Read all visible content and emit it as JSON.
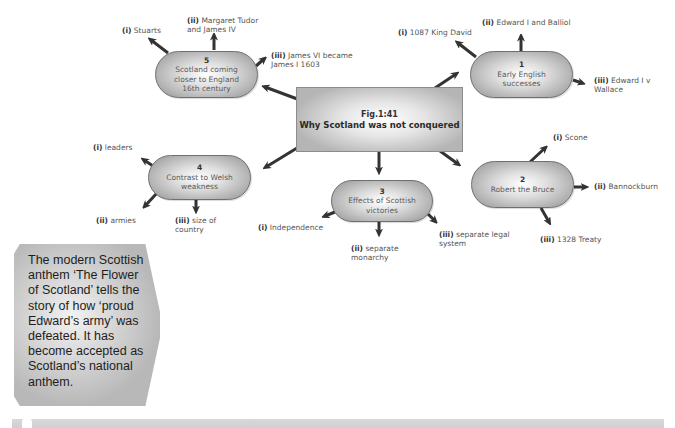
{
  "center": {
    "fig_label": "Fig.1:41",
    "title": "Why Scotland was not conquered"
  },
  "nodes": [
    {
      "number": "1",
      "line1": "Early English",
      "line2": "successes",
      "branches": [
        {
          "numeral": "(i)",
          "text": "1087 King David"
        },
        {
          "numeral": "(ii)",
          "text": "Edward I and Balliol"
        },
        {
          "numeral": "(iii)",
          "text": "Edward I v",
          "text2": "Wallace"
        }
      ]
    },
    {
      "number": "2",
      "line1": "Robert the Bruce",
      "branches": [
        {
          "numeral": "(i)",
          "text": "Scone"
        },
        {
          "numeral": "(ii)",
          "text": "Bannockburn"
        },
        {
          "numeral": "(iii)",
          "text": "1328 Treaty"
        }
      ]
    },
    {
      "number": "3",
      "line1": "Effects of Scottish",
      "line2": "victories",
      "branches": [
        {
          "numeral": "(i)",
          "text": "Independence"
        },
        {
          "numeral": "(ii)",
          "text": "separate",
          "text2": "monarchy"
        },
        {
          "numeral": "(iii)",
          "text": "separate legal",
          "text2": "system"
        }
      ]
    },
    {
      "number": "4",
      "line1": "Contrast to Welsh",
      "line2": "weakness",
      "branches": [
        {
          "numeral": "(i)",
          "text": "leaders"
        },
        {
          "numeral": "(ii)",
          "text": "armies"
        },
        {
          "numeral": "(iii)",
          "text": "size of",
          "text2": "country"
        }
      ]
    },
    {
      "number": "5",
      "line1": "Scotland coming",
      "line2": "closer to England",
      "line3": "16th century",
      "branches": [
        {
          "numeral": "(i)",
          "text": "Stuarts"
        },
        {
          "numeral": "(ii)",
          "text": "Margaret Tudor",
          "text2": "and James IV"
        },
        {
          "numeral": "(iii)",
          "text": "James VI became",
          "text2": "James I 1603"
        }
      ]
    }
  ],
  "callout": {
    "text": "The modern Scottish anthem ‘The Flower of Scotland’ tells the story of how ‘proud Edward’s army’ was defeated. It has become accepted as Scotland’s national anthem."
  },
  "colors": {
    "arrow": "#333333",
    "node_border": "#6f6f6f",
    "footer_bar": "#d4d4d4"
  }
}
